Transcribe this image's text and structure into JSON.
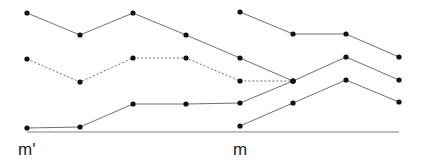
{
  "diagram": {
    "axis": {
      "x1": 27,
      "x2": 399,
      "y": 132,
      "color": "#808080"
    },
    "labels": [
      {
        "text": "m'",
        "x": 18,
        "y": 140
      },
      {
        "text": "m",
        "x": 233,
        "y": 140
      }
    ],
    "series": [
      {
        "style": "solid",
        "points": [
          [
            27,
            13
          ],
          [
            80,
            35
          ],
          [
            133,
            13
          ],
          [
            186,
            35
          ],
          [
            240,
            58
          ],
          [
            293,
            81
          ]
        ]
      },
      {
        "style": "dashed",
        "points": [
          [
            27,
            59
          ],
          [
            80,
            82
          ],
          [
            133,
            58
          ],
          [
            186,
            58
          ],
          [
            240,
            81
          ],
          [
            293,
            81
          ]
        ]
      },
      {
        "style": "solid",
        "points": [
          [
            27,
            128
          ],
          [
            80,
            127
          ],
          [
            133,
            104
          ],
          [
            186,
            104
          ],
          [
            240,
            103
          ],
          [
            293,
            81
          ],
          [
            346,
            57
          ],
          [
            399,
            80
          ]
        ]
      },
      {
        "style": "solid",
        "points": [
          [
            240,
            12
          ],
          [
            293,
            34
          ],
          [
            346,
            34
          ],
          [
            399,
            57
          ]
        ]
      },
      {
        "style": "solid",
        "points": [
          [
            240,
            126
          ],
          [
            293,
            103
          ],
          [
            346,
            80
          ],
          [
            399,
            102
          ]
        ]
      }
    ],
    "line_color": "#707070",
    "dot_color": "#111111"
  }
}
